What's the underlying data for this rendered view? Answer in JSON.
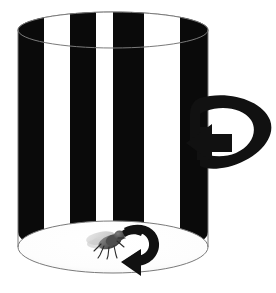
{
  "figure": {
    "caption": "",
    "canvas": {
      "width": 276,
      "height": 293,
      "background": "#ffffff"
    }
  },
  "colors": {
    "stripe_dark": "#0a0a0a",
    "stripe_light": "#ffffff",
    "outline": "#7a7a7a",
    "floor": "#ffffff",
    "arrow": "#111111",
    "fly_body": "#3c3c3c",
    "fly_body_mid": "#6e6e6e",
    "fly_wing": "#c9c9c9",
    "fly_head": "#4a4a4a",
    "fly_leg": "#2b2b2b",
    "fly_shadow": "#d8d8d8"
  },
  "drum": {
    "name": "striped-cylinder",
    "center_x": 113,
    "left_x": 18,
    "right_x": 208,
    "top_y": 12,
    "body_top_y": 30,
    "body_bottom_y": 232,
    "bottom_y": 273,
    "top_ellipse_ry": 18,
    "bottom_ellipse_ry": 26,
    "stripe_count": 8,
    "stripe_pattern": [
      "dark",
      "light",
      "dark",
      "light",
      "dark",
      "light",
      "dark",
      "light"
    ],
    "stripe_edges_px": [
      18,
      44,
      70,
      96,
      113,
      144,
      180,
      208
    ],
    "outline_width": 1
  },
  "rotation_arrow": {
    "name": "drum-rotation-arrow",
    "label": "",
    "direction": "clockwise-viewed-from-above",
    "arrowhead_points": "left",
    "bbox": {
      "x": 186,
      "y": 92,
      "width": 88,
      "height": 82
    }
  },
  "fly_turn_arrow": {
    "name": "fly-turn-arrow",
    "label": "",
    "direction": "clockwise",
    "arrowhead_points": "down-left",
    "bbox": {
      "x": 117,
      "y": 223,
      "width": 45,
      "height": 46
    }
  },
  "fly": {
    "name": "fly",
    "label": "",
    "position": {
      "x": 104,
      "y": 243
    },
    "facing": "upper-right",
    "parts": [
      "wing",
      "thorax",
      "abdomen",
      "head",
      "legs",
      "shadow"
    ],
    "leg_count": 6
  },
  "a11y": {
    "alt": "A tall cylinder painted with alternating black and white vertical stripes. A thick black curved three-dimensional arrow wraps around the right side of the cylinder indicating the drum rotates. On the white floor inside the cylinder sits a small gray fly, and a smaller curved black arrow beside it indicates the fly turning in the same direction."
  }
}
